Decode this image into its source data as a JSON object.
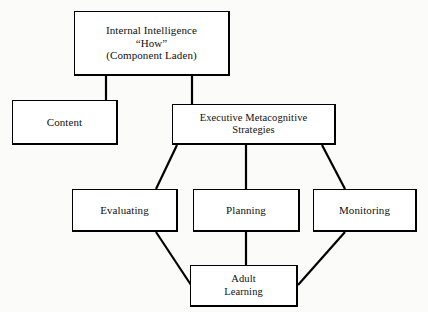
{
  "diagram": {
    "background_color": "#fbfbfa",
    "box_fill_color": "#ffffff",
    "line_color": "#000000",
    "nodes": [
      {
        "id": "internal-intelligence",
        "label": "Internal Intelligence\n“How”\n(Component Laden)",
        "x": 74,
        "y": 11,
        "w": 156,
        "h": 65
      },
      {
        "id": "content",
        "label": "Content",
        "x": 12,
        "y": 100,
        "w": 106,
        "h": 45
      },
      {
        "id": "executive-metacognitive-strategies",
        "label": "Executive Metacognitive\nStrategies",
        "x": 172,
        "y": 104,
        "w": 164,
        "h": 41
      },
      {
        "id": "evaluating",
        "label": "Evaluating",
        "x": 72,
        "y": 189,
        "w": 106,
        "h": 43
      },
      {
        "id": "planning",
        "label": "Planning",
        "x": 193,
        "y": 189,
        "w": 107,
        "h": 43
      },
      {
        "id": "monitoring",
        "label": "Monitoring",
        "x": 313,
        "y": 189,
        "w": 104,
        "h": 43
      },
      {
        "id": "adult-learning",
        "label": "Adult\nLearning",
        "x": 190,
        "y": 265,
        "w": 108,
        "h": 42
      }
    ],
    "edges": [
      {
        "id": "internal-intelligence-to-content",
        "from": "internal-intelligence",
        "to": "content",
        "points": "106,76 106,100"
      },
      {
        "id": "internal-intelligence-to-executive",
        "from": "internal-intelligence",
        "to": "executive-metacognitive-strategies",
        "points": "192,76 192,104"
      },
      {
        "id": "executive-to-evaluating",
        "from": "executive-metacognitive-strategies",
        "to": "evaluating",
        "points": "177,145 156,189"
      },
      {
        "id": "executive-to-planning",
        "from": "executive-metacognitive-strategies",
        "to": "planning",
        "points": "246,145 246,189"
      },
      {
        "id": "executive-to-monitoring",
        "from": "executive-metacognitive-strategies",
        "to": "monitoring",
        "points": "322,145 345,189"
      },
      {
        "id": "evaluating-to-adult-learning",
        "from": "evaluating",
        "to": "adult-learning",
        "points": "156,232 191,285"
      },
      {
        "id": "planning-to-adult-learning",
        "from": "planning",
        "to": "adult-learning",
        "points": "246,232 246,265"
      },
      {
        "id": "monitoring-to-adult-learning",
        "from": "monitoring",
        "to": "adult-learning",
        "points": "345,232 298,285"
      }
    ]
  }
}
